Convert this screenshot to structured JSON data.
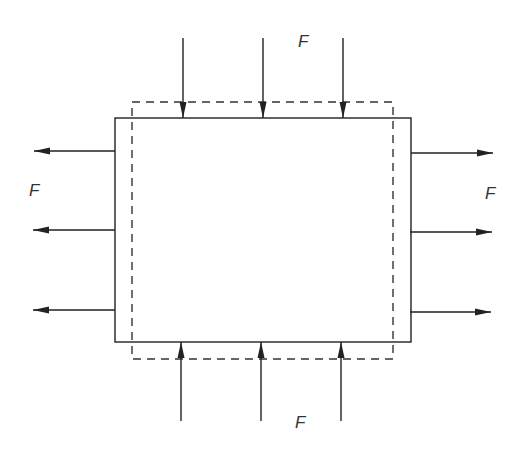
{
  "diagram": {
    "colors": {
      "stroke": "#222222",
      "dashed": "#333333",
      "label": "#333333",
      "background": "#ffffff"
    },
    "labels": {
      "top": "F",
      "bottom": "F",
      "left": "F",
      "right": "F"
    },
    "original_shape": {
      "style": "solid",
      "meaning": "undeformed element"
    },
    "deformed_shape": {
      "style": "dashed",
      "meaning": "deformed element"
    },
    "force_groups": [
      {
        "side": "top",
        "direction": "down",
        "count": 3
      },
      {
        "side": "bottom",
        "direction": "up",
        "count": 3
      },
      {
        "side": "left",
        "direction": "left",
        "count": 3
      },
      {
        "side": "right",
        "direction": "right",
        "count": 3
      }
    ]
  }
}
